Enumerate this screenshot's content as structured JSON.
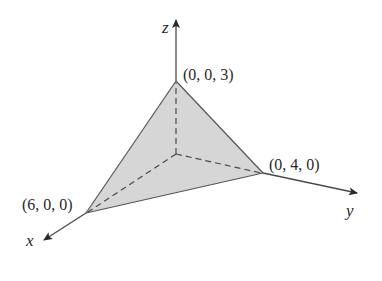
{
  "figure": {
    "colors": {
      "fill": "#d6d6d6",
      "stroke": "#4a4a4a",
      "text": "#2a2a2a",
      "background": "#ffffff"
    },
    "axes": {
      "x": {
        "label": "x"
      },
      "y": {
        "label": "y"
      },
      "z": {
        "label": "z"
      }
    },
    "points": [
      {
        "name": "x-intercept",
        "label": "(6, 0, 0)"
      },
      {
        "name": "y-intercept",
        "label": "(0, 4, 0)"
      },
      {
        "name": "z-intercept",
        "label": "(0, 0, 3)"
      }
    ]
  }
}
